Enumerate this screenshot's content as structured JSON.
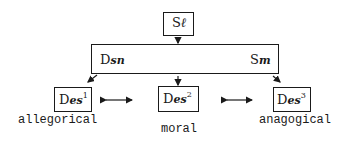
{
  "diagram": {
    "top_node": {
      "prefix": "S",
      "subscript": "ℓ"
    },
    "middle_node": {
      "left_label": {
        "prefix": "D",
        "subscript": "sn"
      },
      "right_label": {
        "prefix": "S",
        "subscript": "m"
      }
    },
    "bottom_nodes": [
      {
        "prefix": "D",
        "subscript": "es",
        "superscript": "1",
        "caption": "allegorical"
      },
      {
        "prefix": "D",
        "subscript": "es",
        "superscript": "2",
        "caption": "moral"
      },
      {
        "prefix": "D",
        "subscript": "es",
        "superscript": "3",
        "caption": "anagogical"
      }
    ],
    "edges": [
      {
        "from": "top_node",
        "to": "middle_node",
        "type": "arrow"
      },
      {
        "from": "middle_node",
        "to": "bottom_nodes.0",
        "type": "arrow"
      },
      {
        "from": "middle_node",
        "to": "bottom_nodes.1",
        "type": "arrow"
      },
      {
        "from": "middle_node",
        "to": "bottom_nodes.2",
        "type": "arrow"
      },
      {
        "from": "bottom_nodes.0",
        "to": "bottom_nodes.1",
        "type": "double-arrow"
      },
      {
        "from": "bottom_nodes.1",
        "to": "bottom_nodes.2",
        "type": "double-arrow"
      }
    ]
  }
}
